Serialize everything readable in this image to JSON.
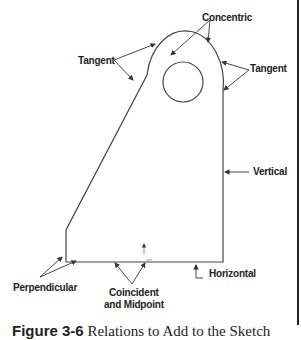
{
  "figure": {
    "labels": {
      "concentric": "Concentric",
      "tangent_left": "Tangent",
      "tangent_right": "Tangent",
      "vertical": "Vertical",
      "horizontal": "Horizontal",
      "perpendicular": "Perpendicular",
      "coincident_line1": "Coincident",
      "coincident_line2": "and Midpoint"
    },
    "caption": {
      "number": "Figure 3-6",
      "text": " Relations to Add to the Sketch"
    }
  }
}
